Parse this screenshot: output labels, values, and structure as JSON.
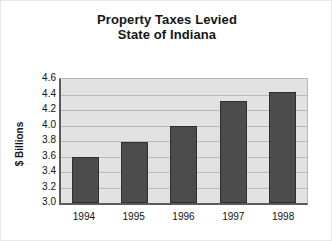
{
  "chart_data": {
    "type": "bar",
    "title": "Property Taxes Levied\nState of Indiana",
    "title_lines": [
      "Property Taxes Levied",
      "State of Indiana"
    ],
    "xlabel": "",
    "ylabel": "$ Billions",
    "categories": [
      "1994",
      "1995",
      "1996",
      "1997",
      "1998"
    ],
    "values": [
      3.6,
      3.79,
      4.0,
      4.31,
      4.43
    ],
    "ylim": [
      3.0,
      4.6
    ],
    "yticks": [
      4.6,
      4.4,
      4.2,
      4.0,
      3.8,
      3.6,
      3.4,
      3.2,
      3.0
    ],
    "ytick_labels": [
      "4.6",
      "4.4",
      "4.2",
      "4.0",
      "3.8",
      "3.6",
      "3.4",
      "3.2",
      "3.0"
    ],
    "grid": true,
    "legend": null,
    "series": [
      {
        "name": "Property taxes levied",
        "values": [
          3.6,
          3.79,
          4.0,
          4.31,
          4.43
        ]
      }
    ],
    "colors": {
      "bar_fill": "#4c4c4c",
      "bar_border": "#2f2f2f",
      "plot_background": "#e2e2e2",
      "gridline": "#b9b9b9",
      "axis_line": "#5a5a5a",
      "text": "#111111",
      "figure_background": "#ffffff"
    }
  }
}
